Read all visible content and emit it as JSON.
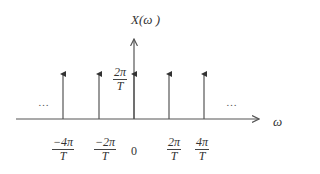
{
  "diagram": {
    "y_axis_label": "X(ω )",
    "x_axis_label": "ω",
    "impulse_height_label": {
      "num": "2π",
      "den": "T"
    },
    "ellipsis_left": "…",
    "ellipsis_right": "…",
    "ticks": [
      {
        "num": "−4π",
        "den": "T"
      },
      {
        "num": "−2π",
        "den": "T"
      },
      {
        "zero": "0"
      },
      {
        "num": "2π",
        "den": "T"
      },
      {
        "num": "4π",
        "den": "T"
      }
    ],
    "colors": {
      "stroke": "#555555",
      "text": "#333333"
    }
  }
}
